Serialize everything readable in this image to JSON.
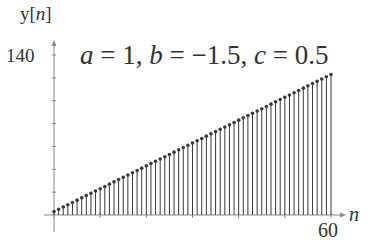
{
  "chart_data": {
    "type": "stem",
    "title_parts": {
      "a_label": "a",
      "a_val": "= 1,",
      "b_label": "b",
      "b_val": "= −1.5,",
      "c_label": "c",
      "c_val": "= 0.5"
    },
    "xlabel": "n",
    "ylabel": "y[n]",
    "ylabel_parts": {
      "prefix": "y[",
      "var": "n",
      "suffix": "]"
    },
    "x_tick_labels": [
      "60"
    ],
    "y_tick_labels": [
      "140"
    ],
    "xlim": [
      0,
      60
    ],
    "ylim": [
      0,
      140
    ],
    "y_minor_ticks": [
      20,
      40,
      60,
      80,
      100,
      120,
      140
    ],
    "x_minor_ticks": [
      0,
      10,
      20,
      30,
      40,
      50,
      60
    ],
    "grid": false,
    "x": [
      0,
      1,
      2,
      3,
      4,
      5,
      6,
      7,
      8,
      9,
      10,
      11,
      12,
      13,
      14,
      15,
      16,
      17,
      18,
      19,
      20,
      21,
      22,
      23,
      24,
      25,
      26,
      27,
      28,
      29,
      30,
      31,
      32,
      33,
      34,
      35,
      36,
      37,
      38,
      39,
      40,
      41,
      42,
      43,
      44,
      45,
      46,
      47,
      48,
      49,
      50,
      51,
      52,
      53,
      54,
      55,
      56,
      57,
      58,
      59,
      60
    ],
    "values": [
      3,
      5,
      7,
      9,
      11,
      13,
      15,
      17,
      19,
      21,
      23,
      25,
      27,
      29,
      31,
      33,
      35,
      37,
      39,
      41,
      43,
      45,
      47,
      49,
      51,
      53,
      55,
      57,
      59,
      61,
      63,
      65,
      67,
      69,
      71,
      73,
      75,
      77,
      79,
      81,
      83,
      85,
      87,
      89,
      91,
      93,
      95,
      97,
      99,
      101,
      103,
      105,
      107,
      109,
      111,
      113,
      115,
      117,
      119,
      121,
      123
    ]
  },
  "colors": {
    "stem": "#3a3a3a",
    "axis": "#8a8a8a",
    "text": "#333333"
  }
}
